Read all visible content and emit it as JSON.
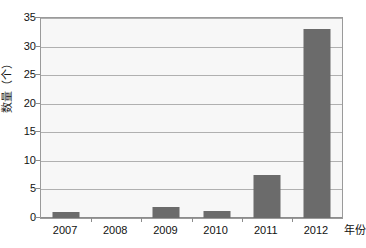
{
  "chart_data": {
    "type": "bar",
    "title": "",
    "subtitle": "",
    "categories": [
      "2007",
      "2008",
      "2009",
      "2010",
      "2011",
      "2012"
    ],
    "values": [
      1,
      0,
      2,
      1.2,
      7.5,
      33
    ],
    "xlabel": "年份",
    "ylabel": "数量（个）",
    "ylim": [
      0,
      35
    ],
    "ytick_step": 5,
    "yticks": [
      "35",
      "30",
      "25",
      "20",
      "15",
      "10",
      "5",
      "0"
    ],
    "ytick_values": [
      35,
      30,
      25,
      20,
      15,
      10,
      5,
      0
    ],
    "grid": true,
    "legend": false,
    "legend_position": "none",
    "colors": {
      "bar": "#6b6b6b",
      "plot_background": "#f7f7f7",
      "gridline": "#b0b0b0",
      "axis": "#8c8c8c",
      "text": "#111111",
      "page_background": "#ffffff"
    }
  }
}
